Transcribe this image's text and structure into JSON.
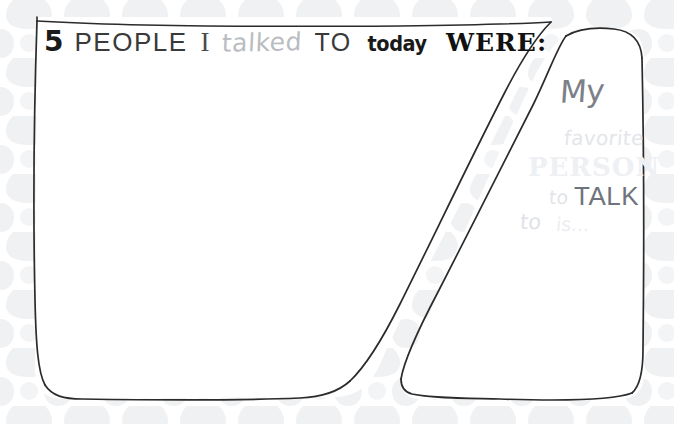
{
  "page": {
    "kind": "printable-journal-prompt-page",
    "width": 674,
    "height": 424,
    "background_color": "#ffffff",
    "pattern_color": "#f0f1f3",
    "ink_color": "#2b2b2b"
  },
  "title": {
    "full_text": "5 PEOPLE I talked TO today WERE:",
    "count": "5",
    "people_label": "PEOPLE",
    "pronoun": "I",
    "verb": "talked",
    "preposition": "TO",
    "when": "today",
    "were_label": "WERE:"
  },
  "left_panel": {
    "name": "answer-box",
    "content": "",
    "placeholder": ""
  },
  "right_panel": {
    "name": "favorite-person-box",
    "prompt_full": "My favorite PERSON to TALK to is...",
    "line_my": "My",
    "line_favorite": "favorite",
    "line_person": "PERSON",
    "line_to_1": "to",
    "line_talk": "TALK",
    "line_to_2": "to",
    "line_is": "is...",
    "content": ""
  },
  "colors": {
    "ink": "#2b2b2b",
    "title_dark": "#1a1a1a",
    "title_gray": "#3a3a3a",
    "script_light": "#b9bcc0",
    "ghost_light": "#eef0f3",
    "pattern": "#f0f1f3"
  }
}
